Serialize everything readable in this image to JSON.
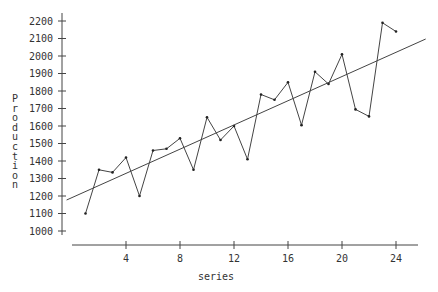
{
  "chart_data": {
    "type": "line",
    "title": "",
    "xlabel": "series",
    "ylabel": "Production",
    "xlim": [
      0,
      26.5
    ],
    "ylim": [
      1000,
      2200
    ],
    "xticks": [
      4,
      8,
      12,
      16,
      20,
      24
    ],
    "yticks": [
      1000,
      1100,
      1200,
      1300,
      1400,
      1500,
      1600,
      1700,
      1800,
      1900,
      2000,
      2100,
      2200
    ],
    "grid": false,
    "legend": null,
    "series": [
      {
        "name": "Production",
        "style": "line-with-points",
        "x": [
          1,
          2,
          3,
          4,
          5,
          6,
          7,
          8,
          9,
          10,
          11,
          12,
          13,
          14,
          15,
          16,
          17,
          18,
          19,
          20,
          21,
          22,
          23,
          24
        ],
        "values": [
          1100,
          1350,
          1335,
          1420,
          1200,
          1460,
          1470,
          1530,
          1350,
          1650,
          1520,
          1600,
          1410,
          1780,
          1750,
          1850,
          1605,
          1910,
          1840,
          2010,
          1695,
          1655,
          2190,
          2140
        ]
      },
      {
        "name": "Linear trend",
        "style": "line",
        "x": [
          -0.4,
          26.2
        ],
        "values": [
          1177,
          2097
        ]
      }
    ]
  },
  "labels": {
    "xlabel": "series",
    "ylabel": "Production"
  }
}
